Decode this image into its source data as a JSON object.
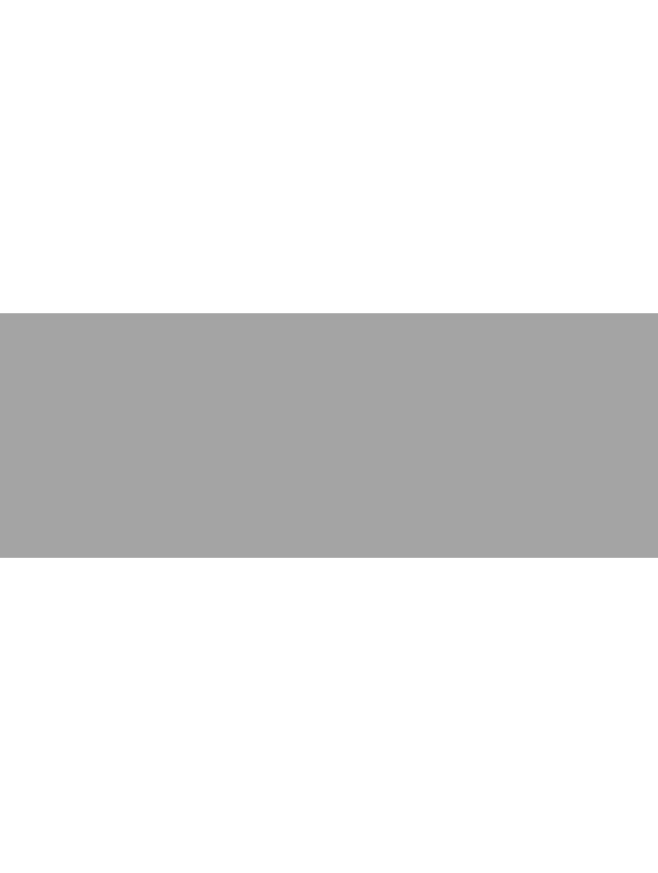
{
  "page": {
    "background_color": "#ffffff"
  },
  "band": {
    "color": "#a4a4a4",
    "top": 313,
    "height": 245
  }
}
